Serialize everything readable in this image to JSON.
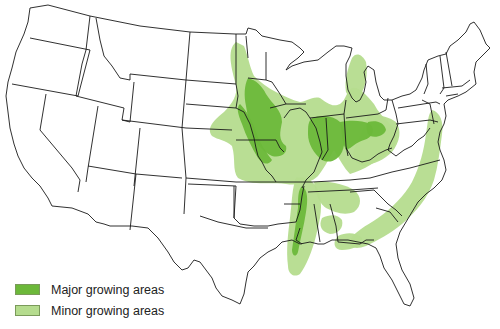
{
  "map": {
    "subject": "Contiguous United States — growing areas",
    "regions": {
      "major": {
        "label": "Major growing areas",
        "color": "#6cb83a"
      },
      "minor": {
        "label": "Minor growing areas",
        "color": "#b5dc8e"
      }
    },
    "outline_color": "#1a1a1a",
    "background": "#ffffff"
  },
  "legend": {
    "items": [
      {
        "label": "Major growing areas",
        "color": "#6cb83a"
      },
      {
        "label": "Minor growing areas",
        "color": "#b5dc8e"
      }
    ]
  }
}
